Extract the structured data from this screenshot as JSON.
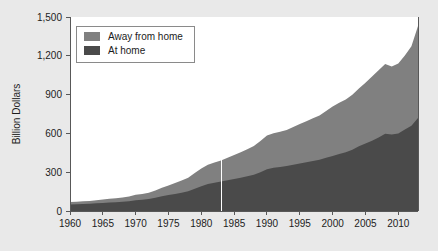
{
  "chart_data": {
    "type": "area",
    "stacked": true,
    "title": "",
    "subtitle": "",
    "xlabel": "",
    "ylabel": "Billion Dollars",
    "xlim": [
      1960,
      2013
    ],
    "ylim": [
      0,
      1500
    ],
    "grid": false,
    "legend_position": "top-left",
    "x_tick_labels": [
      "1960",
      "1965",
      "1970",
      "1975",
      "1980",
      "1985",
      "1990",
      "1995",
      "2000",
      "2005",
      "2010"
    ],
    "x_ticks": [
      1960,
      1965,
      1970,
      1975,
      1980,
      1985,
      1990,
      1995,
      2000,
      2005,
      2010
    ],
    "y_tick_labels": [
      "0",
      "300",
      "600",
      "900",
      "1,200",
      "1,500"
    ],
    "y_ticks": [
      0,
      300,
      600,
      900,
      1200,
      1500
    ],
    "x": [
      1960,
      1961,
      1962,
      1963,
      1964,
      1965,
      1966,
      1967,
      1968,
      1969,
      1970,
      1971,
      1972,
      1973,
      1974,
      1975,
      1976,
      1977,
      1978,
      1979,
      1980,
      1981,
      1982,
      1983,
      1984,
      1985,
      1986,
      1987,
      1988,
      1989,
      1990,
      1991,
      1992,
      1993,
      1994,
      1995,
      1996,
      1997,
      1998,
      1999,
      2000,
      2001,
      2002,
      2003,
      2004,
      2005,
      2006,
      2007,
      2008,
      2009,
      2010,
      2011,
      2012,
      2013
    ],
    "series": [
      {
        "name": "At home",
        "color": "#4a4a4a",
        "values": [
          51,
          52,
          54,
          56,
          59,
          62,
          66,
          68,
          71,
          76,
          83,
          87,
          92,
          102,
          114,
          124,
          132,
          142,
          153,
          173,
          192,
          209,
          219,
          228,
          238,
          247,
          258,
          268,
          280,
          300,
          322,
          334,
          340,
          347,
          358,
          368,
          377,
          387,
          396,
          411,
          426,
          441,
          455,
          474,
          500,
          521,
          544,
          568,
          597,
          592,
          600,
          630,
          660,
          720
        ]
      },
      {
        "name": "Away from home",
        "color": "#808080",
        "values": [
          19,
          20,
          21,
          22,
          24,
          26,
          28,
          30,
          33,
          37,
          42,
          45,
          50,
          57,
          65,
          74,
          84,
          93,
          104,
          120,
          136,
          148,
          156,
          163,
          174,
          186,
          197,
          209,
          222,
          242,
          262,
          268,
          272,
          279,
          292,
          305,
          317,
          330,
          343,
          362,
          382,
          396,
          408,
          424,
          448,
          470,
          496,
          520,
          540,
          525,
          540,
          572,
          614,
          710
        ]
      }
    ],
    "annotations": [
      {
        "type": "vertical-line",
        "x": 1983,
        "color": "#ffffff"
      }
    ]
  },
  "legend": {
    "entries": [
      {
        "label": "Away from home",
        "color": "#808080"
      },
      {
        "label": "At home",
        "color": "#4a4a4a"
      }
    ]
  },
  "axis": {
    "y_title": "Billion Dollars"
  },
  "colors": {
    "page_background": "#e9e9e9",
    "plot_background": "#ffffff",
    "axis": "#585858",
    "text": "#1c1c1c",
    "away_from_home": "#808080",
    "at_home": "#4a4a4a"
  }
}
